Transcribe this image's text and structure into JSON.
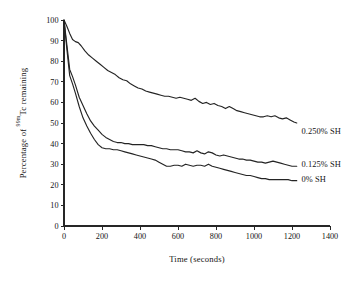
{
  "chart_data": {
    "type": "line",
    "title": "",
    "xlabel": "Time (seconds)",
    "ylabel_parts": {
      "prefix": "Percentage of ",
      "superscript": "99m",
      "element": "Tc",
      "suffix": " remaining"
    },
    "ylabel": "Percentage of 99mTc remaining",
    "xlim": [
      0,
      1400
    ],
    "ylim": [
      0,
      100
    ],
    "xticks": [
      0,
      200,
      400,
      600,
      800,
      1000,
      1200,
      1400
    ],
    "yticks": [
      0,
      10,
      20,
      30,
      40,
      50,
      60,
      70,
      80,
      90,
      100
    ],
    "grid": false,
    "legend_position": "right-inline",
    "line_color": "#242424",
    "series": [
      {
        "name": "0.250% SH",
        "label": "0.250% SH",
        "label_x": 1250,
        "label_y": 46,
        "x": [
          0,
          15,
          30,
          45,
          60,
          75,
          90,
          110,
          130,
          150,
          170,
          190,
          210,
          230,
          250,
          270,
          290,
          310,
          330,
          350,
          370,
          390,
          410,
          430,
          450,
          470,
          490,
          510,
          530,
          550,
          570,
          590,
          610,
          630,
          650,
          670,
          690,
          710,
          730,
          750,
          770,
          790,
          810,
          830,
          850,
          870,
          890,
          910,
          930,
          950,
          970,
          990,
          1010,
          1030,
          1050,
          1070,
          1090,
          1110,
          1130,
          1150,
          1170,
          1190,
          1210,
          1225
        ],
        "values": [
          100,
          97,
          93.5,
          90.5,
          89.5,
          89,
          87.5,
          85,
          83,
          81.5,
          80,
          78.5,
          77,
          75.5,
          74.5,
          73.5,
          72,
          71,
          70.5,
          69,
          68,
          67,
          66.5,
          65.5,
          65,
          64.5,
          64,
          63.5,
          63,
          63,
          62.5,
          62,
          62.5,
          62,
          61.5,
          61,
          62,
          60.5,
          59.5,
          60,
          59,
          59.5,
          58.5,
          58,
          57,
          58,
          57,
          56,
          55.5,
          55,
          54.5,
          54,
          53.5,
          53,
          53,
          53.5,
          53,
          53.5,
          52.5,
          52,
          52.5,
          51.5,
          50.5,
          50
        ]
      },
      {
        "name": "0.125% SH",
        "label": "0.125% SH",
        "label_x": 1250,
        "label_y": 30,
        "x": [
          0,
          15,
          30,
          45,
          60,
          80,
          100,
          120,
          140,
          160,
          180,
          200,
          220,
          240,
          260,
          280,
          300,
          320,
          340,
          360,
          380,
          400,
          420,
          440,
          460,
          480,
          500,
          520,
          540,
          560,
          580,
          600,
          620,
          640,
          660,
          680,
          700,
          720,
          740,
          760,
          780,
          800,
          820,
          840,
          860,
          880,
          900,
          920,
          940,
          960,
          980,
          1000,
          1020,
          1040,
          1060,
          1080,
          1100,
          1120,
          1140,
          1160,
          1180,
          1200,
          1225
        ],
        "values": [
          100,
          88,
          76,
          72.5,
          68.5,
          62.5,
          58.5,
          54.5,
          51,
          48.5,
          46.5,
          44.5,
          43,
          42,
          41,
          40.5,
          40.5,
          40,
          40,
          39.5,
          39.5,
          39.5,
          39.5,
          39,
          39,
          38.5,
          38,
          37.5,
          37.5,
          37,
          37,
          37,
          36.5,
          36,
          36,
          35.5,
          36.5,
          35.5,
          35,
          36,
          35.5,
          34.5,
          34,
          34.5,
          34,
          33.5,
          33,
          32.5,
          32.5,
          32,
          32,
          31.5,
          31,
          31,
          30.5,
          31,
          31.5,
          31,
          30.5,
          30,
          29.5,
          29,
          29
        ]
      },
      {
        "name": "0% SH",
        "label": "0% SH",
        "label_x": 1250,
        "label_y": 23,
        "x": [
          0,
          15,
          30,
          45,
          60,
          80,
          100,
          120,
          140,
          160,
          180,
          200,
          220,
          240,
          260,
          280,
          300,
          320,
          340,
          360,
          380,
          400,
          420,
          440,
          460,
          480,
          500,
          520,
          540,
          560,
          580,
          600,
          620,
          640,
          660,
          680,
          700,
          720,
          740,
          760,
          780,
          800,
          820,
          840,
          860,
          880,
          900,
          920,
          940,
          960,
          980,
          1000,
          1020,
          1040,
          1060,
          1080,
          1100,
          1120,
          1140,
          1160,
          1180,
          1200,
          1225
        ],
        "values": [
          100,
          86,
          73,
          69,
          64.5,
          58,
          52.5,
          48.5,
          45,
          42,
          39.5,
          38,
          37.5,
          37.5,
          37,
          37,
          36.5,
          36,
          35.5,
          35,
          34.5,
          34,
          33.5,
          33,
          32.5,
          32,
          31,
          30,
          29,
          29,
          29.5,
          29.5,
          29,
          30,
          29.5,
          29,
          29.5,
          29.5,
          29,
          30,
          29,
          28.5,
          28,
          27.5,
          27,
          26.5,
          26,
          25.5,
          25,
          24.5,
          24.5,
          24,
          23.5,
          23,
          23,
          22.5,
          22.5,
          22.5,
          22.5,
          22.5,
          22.5,
          22,
          22
        ]
      }
    ]
  }
}
